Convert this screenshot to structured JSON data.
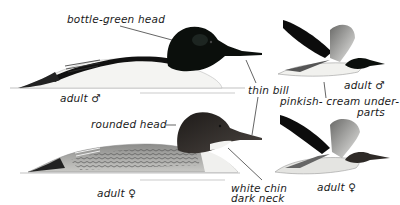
{
  "plate": {
    "subject": "Goosander / Common Merganser identification plate",
    "colors": {
      "background": "#ffffff",
      "male_head": "#0b0f0c",
      "female_head": "#2e2a27",
      "male_body": "#f4f4f2",
      "female_body": "#9a9a98",
      "annotation_ink": "#1a1a1a"
    }
  },
  "labels": {
    "male_head": "bottle-green head",
    "bill": "thin bill",
    "male_swimming": "adult ♂",
    "male_flying": "adult ♂",
    "underparts_line1": "pinkish- cream under-",
    "underparts_line2": "parts",
    "female_head": "rounded head",
    "female_neck_line1": "white chin",
    "female_neck_line2": "dark neck",
    "female_swimming": "adult ♀",
    "female_flying": "adult ♀"
  },
  "figures": [
    {
      "id": "male-swimming",
      "sex": "male",
      "pose": "swimming"
    },
    {
      "id": "male-flying",
      "sex": "male",
      "pose": "flying"
    },
    {
      "id": "female-swimming",
      "sex": "female",
      "pose": "swimming"
    },
    {
      "id": "female-flying",
      "sex": "female",
      "pose": "flying"
    }
  ]
}
